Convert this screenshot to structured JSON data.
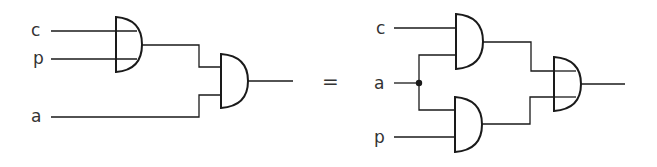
{
  "diagram": {
    "type": "logic-circuit-equivalence",
    "colors": {
      "line": "#1a1a1a",
      "text": "#333333",
      "background": "#ffffff"
    },
    "left_circuit": {
      "inputs": [
        {
          "label": "c"
        },
        {
          "label": "p"
        },
        {
          "label": "a"
        }
      ],
      "gates": [
        {
          "id": "L1",
          "shape": "gate-with-through-lines",
          "inputs": [
            "c",
            "p"
          ]
        },
        {
          "id": "L2",
          "shape": "and-gate",
          "inputs": [
            "L1",
            "a"
          ]
        }
      ],
      "output": "L2"
    },
    "equals_sign": "=",
    "right_circuit": {
      "inputs": [
        {
          "label": "c"
        },
        {
          "label": "a"
        },
        {
          "label": "p"
        }
      ],
      "junction": "a",
      "gates": [
        {
          "id": "R1",
          "shape": "and-gate",
          "inputs": [
            "c",
            "a"
          ]
        },
        {
          "id": "R2",
          "shape": "and-gate",
          "inputs": [
            "a",
            "p"
          ]
        },
        {
          "id": "R3",
          "shape": "gate-with-through-lines",
          "inputs": [
            "R1",
            "R2"
          ]
        }
      ],
      "output": "R3"
    }
  }
}
